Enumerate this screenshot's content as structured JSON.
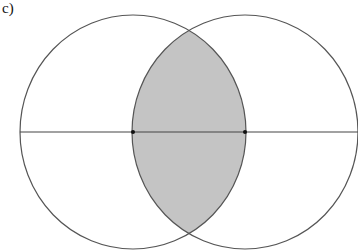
{
  "figure": {
    "label": "c)",
    "colors": {
      "stroke": "#555555",
      "fill_intersection": "#c4c4c4",
      "background": "#ffffff",
      "points": "#111111"
    },
    "circles": [
      {
        "name": "left-circle",
        "cx": 133,
        "cy": 132,
        "rx": 113,
        "ry": 117
      },
      {
        "name": "right-circle",
        "cx": 245,
        "cy": 132,
        "rx": 113,
        "ry": 117
      }
    ],
    "line": {
      "x1": 20,
      "y1": 132,
      "x2": 358,
      "y2": 132
    },
    "points": [
      {
        "name": "left-center-point",
        "x": 133,
        "y": 132
      },
      {
        "name": "right-center-point",
        "x": 245,
        "y": 132
      }
    ]
  }
}
